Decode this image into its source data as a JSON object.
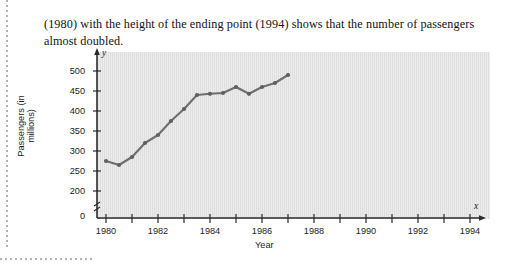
{
  "paragraph": {
    "text": "(1980) with the height of the ending point (1994) shows that the number of passengers almost doubled."
  },
  "figure": {
    "x_axis_var": "x",
    "y_axis_var": "y"
  },
  "chart_data": {
    "type": "line",
    "title": "",
    "xlabel": "Year",
    "ylabel": "Passengers (in millions)",
    "x": [
      1980,
      1981,
      1982,
      1983,
      1984,
      1985,
      1986,
      1987,
      1988,
      1989,
      1990,
      1991,
      1992,
      1993,
      1994
    ],
    "values": [
      275,
      265,
      285,
      320,
      340,
      375,
      405,
      440,
      443,
      445,
      460,
      443,
      460,
      470,
      490
    ],
    "xlim": [
      1980,
      1994
    ],
    "ylim": [
      200,
      512
    ],
    "y_axis_break": true,
    "ytick_labels": [
      "0",
      "200",
      "250",
      "300",
      "350",
      "400",
      "450",
      "500"
    ],
    "yticks": [
      0,
      200,
      250,
      300,
      350,
      400,
      450,
      500
    ],
    "xtick_labels": [
      "1980",
      "1982",
      "1984",
      "1986",
      "1988",
      "1990",
      "1992",
      "1994"
    ],
    "xticks": [
      1980,
      1982,
      1984,
      1986,
      1988,
      1990,
      1992,
      1994
    ],
    "minor_xticks": [
      1981,
      1983,
      1985,
      1987,
      1989,
      1991,
      1993
    ],
    "grid": false,
    "legend": "none",
    "line_color": "#6e6e6e",
    "marker": "circle",
    "panel_color": "#e2e2e2"
  }
}
